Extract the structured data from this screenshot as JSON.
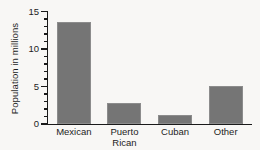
{
  "chart_data": {
    "type": "bar",
    "title": "",
    "xlabel": "",
    "ylabel": "Population in millions",
    "categories": [
      "Mexican",
      "Puerto\nRican",
      "Cuban",
      "Other"
    ],
    "values": [
      13.6,
      2.8,
      1.2,
      5.1
    ],
    "ylim": [
      0,
      15
    ],
    "ytick_labels": [
      "0",
      "5",
      "10",
      "15"
    ],
    "ytick_values": [
      0,
      5,
      10,
      15
    ],
    "yminor_step": 1,
    "grid": false,
    "legend": null,
    "bar_color": "#757575",
    "axis_color": "#1a1a1a",
    "background_color": "#f8f7f5"
  },
  "axis": {
    "y_title": "Population in millions",
    "ticks": [
      {
        "label": "15"
      },
      {
        "label": "10"
      },
      {
        "label": "5"
      },
      {
        "label": "0"
      }
    ]
  },
  "bars": [
    {
      "label": "Mexican",
      "label_line1": "Mexican",
      "label_line2": "",
      "value": 13.6
    },
    {
      "label": "Puerto Rican",
      "label_line1": "Puerto",
      "label_line2": "Rican",
      "value": 2.8
    },
    {
      "label": "Cuban",
      "label_line1": "Cuban",
      "label_line2": "",
      "value": 1.2
    },
    {
      "label": "Other",
      "label_line1": "Other",
      "label_line2": "",
      "value": 5.1
    }
  ]
}
